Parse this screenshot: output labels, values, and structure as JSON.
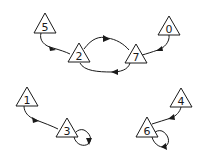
{
  "diagram": {
    "type": "functional-graph",
    "colors": {
      "stroke": "#1a1a1a",
      "background": "#ffffff"
    },
    "nodes": [
      {
        "id": "5",
        "label": "5",
        "cx": 45,
        "apex_y": 13,
        "base_y": 33,
        "half_w": 11
      },
      {
        "id": "2",
        "label": "2",
        "cx": 79,
        "apex_y": 43,
        "base_y": 62,
        "half_w": 11
      },
      {
        "id": "7",
        "label": "7",
        "cx": 136,
        "apex_y": 44,
        "base_y": 63,
        "half_w": 11
      },
      {
        "id": "0",
        "label": "0",
        "cx": 169,
        "apex_y": 16,
        "base_y": 35,
        "half_w": 11
      },
      {
        "id": "1",
        "label": "1",
        "cx": 27,
        "apex_y": 87,
        "base_y": 106,
        "half_w": 11
      },
      {
        "id": "3",
        "label": "3",
        "cx": 67,
        "apex_y": 118,
        "base_y": 137,
        "half_w": 11
      },
      {
        "id": "4",
        "label": "4",
        "cx": 181,
        "apex_y": 88,
        "base_y": 107,
        "half_w": 11
      },
      {
        "id": "6",
        "label": "6",
        "cx": 147,
        "apex_y": 117,
        "base_y": 137,
        "half_w": 11
      }
    ],
    "edges": [
      {
        "from": "5",
        "to": "2"
      },
      {
        "from": "2",
        "to": "7"
      },
      {
        "from": "7",
        "to": "2"
      },
      {
        "from": "0",
        "to": "7"
      },
      {
        "from": "1",
        "to": "3"
      },
      {
        "from": "3",
        "to": "3"
      },
      {
        "from": "4",
        "to": "6"
      },
      {
        "from": "6",
        "to": "6"
      }
    ]
  }
}
